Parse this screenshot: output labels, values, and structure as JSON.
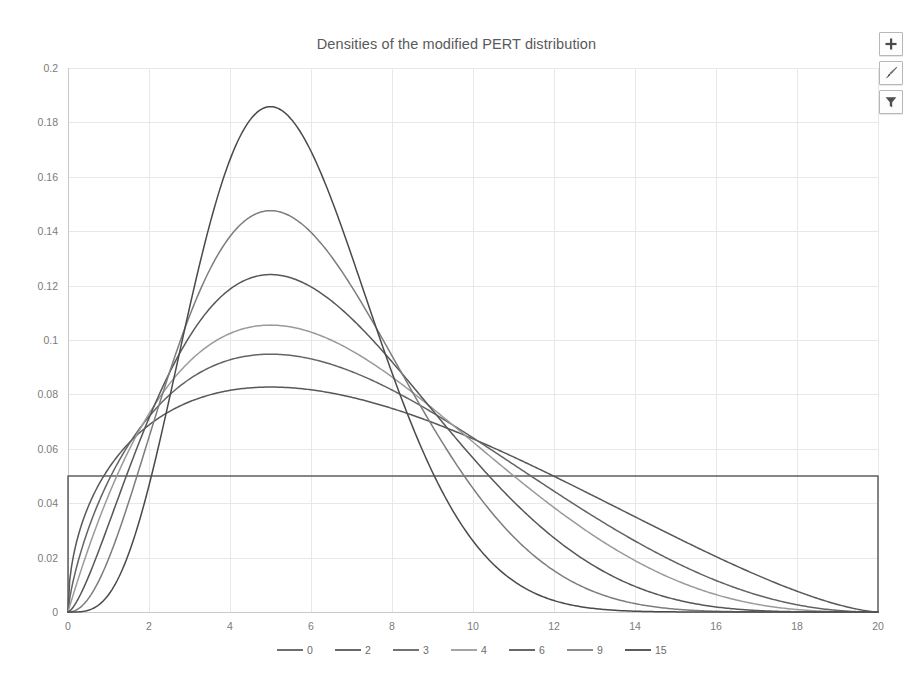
{
  "window": {
    "background": "#ffffff"
  },
  "header": {
    "title": "Densities of the modified PERT distribution"
  },
  "chart_buttons": [
    {
      "name": "chart-elements-button",
      "icon": "plus-icon",
      "label": "+"
    },
    {
      "name": "chart-styles-button",
      "icon": "paintbrush-icon",
      "label": ""
    },
    {
      "name": "chart-filters-button",
      "icon": "funnel-icon",
      "label": ""
    }
  ],
  "chart_data": {
    "type": "line",
    "title": "Densities of the modified PERT distribution",
    "subtitle": "",
    "xlabel": "",
    "ylabel": "",
    "xlim": [
      0,
      20
    ],
    "ylim": [
      0,
      0.2
    ],
    "grid": true,
    "legend_position": "bottom",
    "xticks": [
      0,
      2,
      4,
      6,
      8,
      10,
      12,
      14,
      16,
      18,
      20
    ],
    "xtick_labels": [
      "0",
      "2",
      "4",
      "6",
      "8",
      "10",
      "12",
      "14",
      "16",
      "18",
      "20"
    ],
    "yticks": [
      0,
      0.02,
      0.04,
      0.06,
      0.08,
      0.1,
      0.12,
      0.14,
      0.16,
      0.18,
      0.2
    ],
    "ytick_labels": [
      "0",
      "0.02",
      "0.04",
      "0.06",
      "0.08",
      "0.1",
      "0.12",
      "0.14",
      "0.16",
      "0.18",
      "0.2"
    ],
    "distribution": {
      "min": 0,
      "max": 20,
      "mode": 5,
      "family": "modified PERT (scaled Beta)"
    },
    "legend": [
      "0",
      "2",
      "3",
      "4",
      "6",
      "9",
      "15"
    ],
    "series": [
      {
        "name": "0",
        "gamma": 0,
        "color": "#5f5f5f",
        "peak_value": 0.05,
        "peak_x": null,
        "note": "uniform density, flat at 0.05 over [0,20]",
        "x": [
          0,
          0.0001,
          10,
          19.9999,
          20
        ],
        "values": [
          0,
          0.05,
          0.05,
          0.05,
          0
        ]
      },
      {
        "name": "2",
        "gamma": 2,
        "color": "#585858",
        "peak_value": 0.0825,
        "peak_x": 5.0,
        "x": [
          0,
          1,
          2,
          3,
          4,
          5,
          6,
          7,
          8,
          9,
          10,
          11,
          12,
          13,
          14,
          15,
          16,
          17,
          18,
          19,
          20
        ],
        "values": [
          0,
          0.0418,
          0.0635,
          0.0752,
          0.0808,
          0.0825,
          0.0815,
          0.0787,
          0.0745,
          0.0694,
          0.0635,
          0.057,
          0.0501,
          0.043,
          0.0357,
          0.0284,
          0.0212,
          0.0143,
          0.008,
          0.0027,
          0
        ]
      },
      {
        "name": "3",
        "gamma": 3,
        "color": "#646464",
        "peak_value": 0.0945,
        "peak_x": 5.0,
        "x": [
          0,
          1,
          2,
          3,
          4,
          5,
          6,
          7,
          8,
          9,
          10,
          11,
          12,
          13,
          14,
          15,
          16,
          17,
          18,
          19,
          20
        ],
        "values": [
          0,
          0.0345,
          0.0658,
          0.0851,
          0.0936,
          0.0945,
          0.0904,
          0.0834,
          0.0748,
          0.0656,
          0.0563,
          0.0473,
          0.0389,
          0.031,
          0.0239,
          0.0175,
          0.0119,
          0.0072,
          0.0035,
          0.001,
          0
        ]
      },
      {
        "name": "4",
        "gamma": 4,
        "color": "#9a9a9a",
        "peak_value": 0.105,
        "peak_x": 5.0,
        "x": [
          0,
          1,
          2,
          3,
          4,
          5,
          6,
          7,
          8,
          9,
          10,
          11,
          12,
          13,
          14,
          15,
          16,
          17,
          18,
          19,
          20
        ],
        "values": [
          0,
          0.0276,
          0.0653,
          0.0921,
          0.104,
          0.105,
          0.0986,
          0.0878,
          0.075,
          0.062,
          0.0498,
          0.0389,
          0.0295,
          0.0215,
          0.015,
          0.0098,
          0.0059,
          0.0031,
          0.0012,
          0.0003,
          0
        ]
      },
      {
        "name": "6",
        "gamma": 6,
        "color": "#575757",
        "peak_value": 0.124,
        "peak_x": 5.0,
        "x": [
          0,
          1,
          2,
          3,
          4,
          5,
          6,
          7,
          8,
          9,
          10,
          11,
          12,
          13,
          14,
          15,
          16,
          17,
          18,
          19,
          20
        ],
        "values": [
          0,
          0.0166,
          0.0585,
          0.0991,
          0.121,
          0.124,
          0.1133,
          0.0953,
          0.0749,
          0.0555,
          0.0389,
          0.0257,
          0.0159,
          0.0091,
          0.0047,
          0.0021,
          0.0008,
          0.0002,
          3e-05,
          1e-06,
          0
        ]
      },
      {
        "name": "9",
        "gamma": 9,
        "color": "#7d7d7d",
        "peak_value": 0.147,
        "peak_x": 5.0,
        "x": [
          0,
          1,
          2,
          3,
          4,
          5,
          6,
          7,
          8,
          9,
          10,
          11,
          12,
          13,
          14,
          15,
          16,
          17,
          18,
          19,
          20
        ],
        "values": [
          0,
          0.008,
          0.0463,
          0.1015,
          0.1406,
          0.147,
          0.1281,
          0.0981,
          0.066,
          0.039,
          0.02,
          0.0088,
          0.0032,
          0.0009,
          0.0002,
          3e-05,
          2e-06,
          1e-07,
          0,
          0,
          0
        ]
      },
      {
        "name": "15",
        "gamma": 15,
        "color": "#4a4a4a",
        "peak_value": 0.1855,
        "peak_x": 5.0,
        "x": [
          0,
          1,
          2,
          3,
          4,
          5,
          6,
          7,
          8,
          9,
          10,
          11,
          12,
          13,
          14,
          15,
          16,
          17,
          18,
          19,
          20
        ],
        "values": [
          0,
          0.0018,
          0.0262,
          0.0961,
          0.1718,
          0.1855,
          0.1442,
          0.0871,
          0.0413,
          0.0152,
          0.0043,
          0.0009,
          0.0001,
          1e-05,
          4e-07,
          0,
          0,
          0,
          0,
          0,
          0
        ]
      }
    ]
  },
  "plot_geometry": {
    "left": 68,
    "right": 878,
    "top": 68,
    "bottom": 612
  },
  "legend_items": [
    {
      "label": "0",
      "color": "#5f5f5f"
    },
    {
      "label": "2",
      "color": "#585858"
    },
    {
      "label": "3",
      "color": "#646464"
    },
    {
      "label": "4",
      "color": "#9a9a9a"
    },
    {
      "label": "6",
      "color": "#575757"
    },
    {
      "label": "9",
      "color": "#7d7d7d"
    },
    {
      "label": "15",
      "color": "#4a4a4a"
    }
  ],
  "colors": {
    "gridline": "#e8e8e8",
    "axis": "#c9c9c9",
    "title_text": "#5a5a5a",
    "tick_text": "#7b7b7b",
    "background": "#ffffff"
  }
}
